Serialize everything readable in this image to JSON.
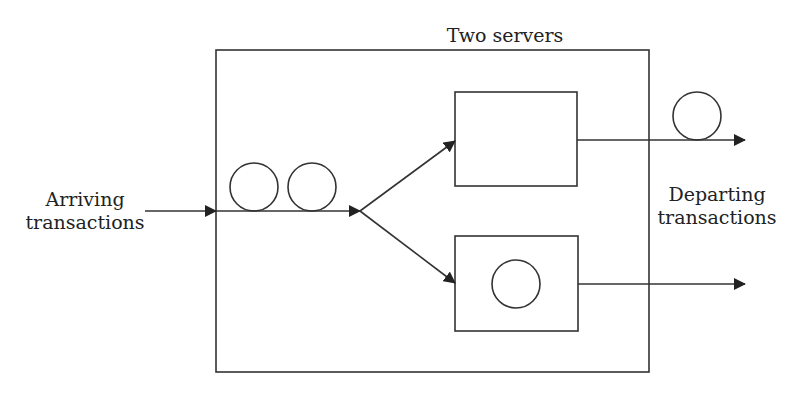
{
  "diagram": {
    "title": "Two servers",
    "input_label_line1": "Arriving",
    "input_label_line2": "transactions",
    "output_label_line1": "Departing",
    "output_label_line2": "transactions",
    "queue_items": 2,
    "servers": [
      {
        "name": "server-1",
        "busy": false
      },
      {
        "name": "server-2",
        "busy": true
      }
    ],
    "departed_items": 1,
    "stroke_color": "#222222"
  }
}
